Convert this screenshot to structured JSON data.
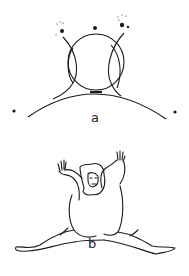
{
  "figures": [
    {
      "id": "a",
      "label": "a",
      "description": "Circle resting on a larger arc, with two crossing curves and dots (stars)"
    },
    {
      "id": "b",
      "label": "b",
      "description": "Figure with arms raised and legs spread in a split"
    }
  ],
  "colors": {
    "ink": "#1a1a1a",
    "background": "#ffffff"
  }
}
